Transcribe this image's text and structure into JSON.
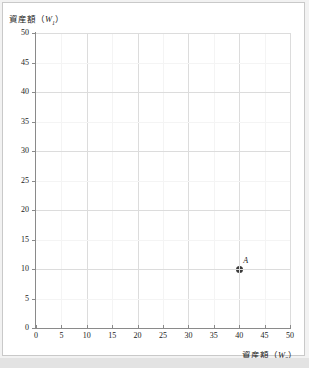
{
  "chart_data": {
    "type": "scatter",
    "title": "",
    "xlabel": "資産額（W0）",
    "ylabel": "資産額（W1）",
    "xlim": [
      0,
      50
    ],
    "ylim": [
      0,
      50
    ],
    "xticks": [
      0,
      5,
      10,
      15,
      20,
      25,
      30,
      35,
      40,
      45,
      50
    ],
    "yticks": [
      0,
      5,
      10,
      15,
      20,
      25,
      30,
      35,
      40,
      45,
      50
    ],
    "grid": true,
    "grid_minor_step": 5,
    "grid_major_step": 10,
    "legend": "none",
    "points": [
      {
        "label": "A",
        "x": 40,
        "y": 10
      }
    ],
    "series": [
      {
        "name": "A",
        "x": [
          40
        ],
        "values": [
          10
        ]
      }
    ],
    "colors": {
      "marker": "#3b3b3b",
      "axis": "#8a8a8a",
      "grid_minor": "#f4f4f4",
      "grid_major": "#dcdcdc",
      "text": "#1a1a1a",
      "background": "#ffffff",
      "frame": "#c9c9c9"
    }
  },
  "axes": {
    "y_title_main": "資産額（",
    "y_title_var": "W",
    "y_title_sub": "1",
    "y_title_close": "）",
    "x_title_main": "資産額（",
    "x_title_var": "W",
    "x_title_sub": "0",
    "x_title_close": "）"
  },
  "annotations": {
    "point_a_label": "A"
  }
}
